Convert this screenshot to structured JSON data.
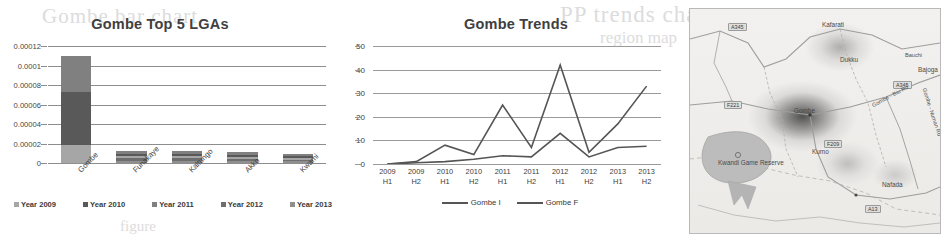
{
  "background_text": {
    "ghost_a": "Gombe bar chart",
    "ghost_b": "PP trends chart",
    "ghost_c": "region map",
    "ghost_d": "figure",
    "ghost_e": "figure"
  },
  "colors": {
    "title": "#404040",
    "gridline": "#8d8d8d",
    "series_dark": "#595959",
    "series_mid": "#6e6e6e",
    "series_light": "#a6a6a6",
    "line_stroke": "#555555",
    "map_hot": "#3c3c3c",
    "map_reserve": "#b9b9b9"
  },
  "bar_chart": {
    "title": "Gombe Top 5 LGAs",
    "yticks": [
      "0",
      "0.00002",
      "0.00004",
      "0.00006",
      "0.00008",
      "0.0001",
      "0.00012"
    ],
    "categories": [
      "Gombe",
      "Funakaye",
      "Kaltungo",
      "Akko",
      "Kwami"
    ],
    "legend": [
      {
        "label": "Year 2009",
        "color": "#a6a6a6"
      },
      {
        "label": "Year 2010",
        "color": "#595959"
      },
      {
        "label": "Year 2011",
        "color": "#808080"
      },
      {
        "label": "Year 2012",
        "color": "#6e6e6e"
      },
      {
        "label": "Year 2013",
        "color": "#8f8f8f"
      }
    ]
  },
  "line_chart": {
    "title": "Gombe Trends",
    "yticks": [
      "0",
      "10",
      "20",
      "30",
      "40",
      "50"
    ],
    "xlabels": [
      {
        "year": "2009",
        "half": "H1"
      },
      {
        "year": "2009",
        "half": "H2"
      },
      {
        "year": "2010",
        "half": "H1"
      },
      {
        "year": "2010",
        "half": "H2"
      },
      {
        "year": "2011",
        "half": "H1"
      },
      {
        "year": "2011",
        "half": "H2"
      },
      {
        "year": "2012",
        "half": "H1"
      },
      {
        "year": "2012",
        "half": "H2"
      },
      {
        "year": "2013",
        "half": "H1"
      },
      {
        "year": "2013",
        "half": "H2"
      }
    ],
    "legend": [
      {
        "label": "Gombe I",
        "color": "#555555"
      },
      {
        "label": "Gombe F",
        "color": "#555555"
      }
    ]
  },
  "map": {
    "place_labels": [
      {
        "name": "Kafarati",
        "x": 132,
        "y": 12
      },
      {
        "name": "Dukku",
        "x": 150,
        "y": 47
      },
      {
        "name": "Bajoga",
        "x": 228,
        "y": 57
      },
      {
        "name": "Gombe",
        "x": 104,
        "y": 98
      },
      {
        "name": "Kumo",
        "x": 122,
        "y": 139
      },
      {
        "name": "Nafada",
        "x": 192,
        "y": 172
      },
      {
        "name": "Kwandi Game Reserve",
        "x": 28,
        "y": 150
      }
    ],
    "road_shields": [
      {
        "ref": "A345",
        "x": 38,
        "y": 14
      },
      {
        "ref": "F221",
        "x": 34,
        "y": 92
      },
      {
        "ref": "A345",
        "x": 203,
        "y": 72
      },
      {
        "ref": "F209",
        "x": 134,
        "y": 131
      },
      {
        "ref": "A13",
        "x": 175,
        "y": 196
      }
    ],
    "road_labels": [
      {
        "name": "Gombe - Biu Rd",
        "x": 180,
        "y": 84
      },
      {
        "name": "Gombe - Numan Rd",
        "x": 217,
        "y": 100
      },
      {
        "name": "Bauchi",
        "x": 215,
        "y": 43
      }
    ]
  },
  "chart_data": [
    {
      "type": "bar",
      "title": "Gombe Top 5 LGAs",
      "xlabel": "",
      "ylabel": "",
      "ylim": [
        0,
        0.00012
      ],
      "grid": true,
      "stacked": true,
      "legend_position": "bottom",
      "categories": [
        "Gombe",
        "Funakaye",
        "Kaltungo",
        "Akko",
        "Kwami"
      ],
      "series": [
        {
          "name": "Year 2009",
          "values": [
            1.8e-05,
            2e-06,
            2.2e-06,
            2e-06,
            1.6e-06
          ]
        },
        {
          "name": "Year 2010",
          "values": [
            5.5e-05,
            2.5e-06,
            2.6e-06,
            2.4e-06,
            1.8e-06
          ]
        },
        {
          "name": "Year 2011",
          "values": [
            3.7e-05,
            2.7e-06,
            2.8e-06,
            2.5e-06,
            1.9e-06
          ]
        },
        {
          "name": "Year 2012",
          "values": [
            0.0,
            2.6e-06,
            2.6e-06,
            2.3e-06,
            1.8e-06
          ]
        },
        {
          "name": "Year 2013",
          "values": [
            0.0,
            2.2e-06,
            2.3e-06,
            2e-06,
            1.7e-06
          ]
        }
      ],
      "totals": [
        0.00011,
        1.2e-05,
        1.25e-05,
        1.12e-05,
        8.8e-06
      ]
    },
    {
      "type": "line",
      "title": "Gombe Trends",
      "xlabel": "",
      "ylabel": "",
      "ylim": [
        0,
        50
      ],
      "grid": true,
      "legend_position": "bottom",
      "x": [
        "2009 H1",
        "2009 H2",
        "2010 H1",
        "2010 H2",
        "2011 H1",
        "2011 H2",
        "2012 H1",
        "2012 H2",
        "2013 H1",
        "2013 H2"
      ],
      "series": [
        {
          "name": "Gombe I",
          "values": [
            0,
            1,
            8,
            4,
            25,
            7,
            42,
            5,
            17,
            33
          ]
        },
        {
          "name": "Gombe F",
          "values": [
            0,
            0.5,
            1,
            2,
            3.5,
            3,
            13,
            3,
            7,
            7.5
          ]
        }
      ]
    }
  ]
}
